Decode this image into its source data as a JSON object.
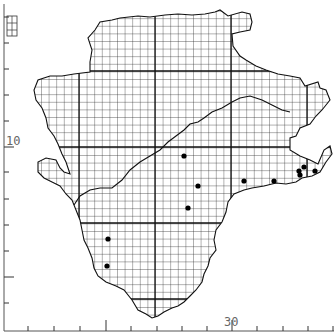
{
  "map": {
    "type": "grid-square distribution map",
    "axis_labels": {
      "y_label": "10",
      "x_label": "30"
    },
    "grid": {
      "cell_px": 7.6,
      "major_every_cells": 10,
      "major_x_px": [
        79,
        155,
        231,
        307
      ],
      "major_y_px": [
        71,
        147,
        223,
        299
      ]
    },
    "left_axis_ticks_y": [
      17,
      43,
      69,
      95,
      121,
      147,
      172,
      199,
      225,
      251,
      277,
      303
    ],
    "bottom_axis_ticks_x": [
      28,
      54,
      80,
      106,
      131,
      157,
      182,
      207,
      232,
      257,
      283,
      308,
      333
    ],
    "legend_square": {
      "x": 7,
      "y": 16,
      "w": 10,
      "h": 20
    },
    "records": [
      {
        "x": 184,
        "y": 156
      },
      {
        "x": 198,
        "y": 186
      },
      {
        "x": 188,
        "y": 208
      },
      {
        "x": 244,
        "y": 181
      },
      {
        "x": 274,
        "y": 181
      },
      {
        "x": 299,
        "y": 171
      },
      {
        "x": 300,
        "y": 175
      },
      {
        "x": 304,
        "y": 167
      },
      {
        "x": 315,
        "y": 171
      },
      {
        "x": 108,
        "y": 239
      },
      {
        "x": 107,
        "y": 266
      }
    ],
    "colors": {
      "grid": "#222222",
      "dot": "#000000",
      "axis": "#555555",
      "label": "#666666"
    }
  }
}
